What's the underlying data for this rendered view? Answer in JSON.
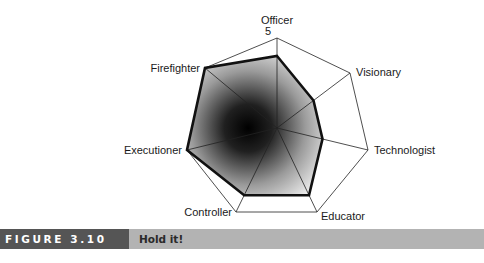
{
  "chart_data": {
    "type": "radar",
    "title": "",
    "categories": [
      "Officer",
      "Visionary",
      "Technologist",
      "Educator",
      "Controller",
      "Executioner",
      "Firefighter"
    ],
    "series": [
      {
        "name": "Profile",
        "values": [
          4,
          2.5,
          2.5,
          4,
          4,
          5,
          5
        ]
      }
    ],
    "scale_max": 5,
    "scale_label": "5",
    "range": [
      0,
      5
    ],
    "grid": "outer heptagon with spokes",
    "fill": "radial gradient, dark center fading to white"
  },
  "figure": {
    "number": "FIGURE 3.10",
    "caption": "Hold it!"
  }
}
